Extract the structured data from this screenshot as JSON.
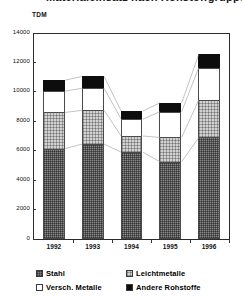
{
  "chart": {
    "title": "Materialeinsatz nach Rohstoffgruppen",
    "unit_label": "TDM"
  },
  "chart_data": {
    "type": "bar",
    "subtype": "stacked-bar",
    "title": "Materialeinsatz nach Rohstoffgruppen",
    "xlabel": "",
    "ylabel": "TDM",
    "ylim": [
      0,
      14000
    ],
    "ytick_step": 2000,
    "yticks": [
      0,
      2000,
      4000,
      6000,
      8000,
      10000,
      12000,
      14000
    ],
    "ytick_labels": [
      "0",
      "2000",
      "4000",
      "6000",
      "8000",
      "10000",
      "12000",
      "14000"
    ],
    "grid": false,
    "legend_position": "bottom",
    "categories": [
      "1992",
      "1993",
      "1994",
      "1995",
      "1996"
    ],
    "series": [
      {
        "name": "Stahl",
        "pattern": "dark-hatch",
        "color": "#8a8a8a",
        "values": [
          6150,
          6450,
          5900,
          5250,
          6900
        ]
      },
      {
        "name": "Leichtmetalle",
        "pattern": "light-dot",
        "color": "#d2d2d2",
        "values": [
          2450,
          2300,
          1100,
          1650,
          2550
        ]
      },
      {
        "name": "Versch. Metalle",
        "pattern": "solid-white",
        "color": "#ffffff",
        "values": [
          1450,
          1500,
          1150,
          1750,
          2200
        ]
      },
      {
        "name": "Andere Rohstoffe",
        "pattern": "solid-black",
        "color": "#0d0d0d",
        "values": [
          750,
          800,
          550,
          600,
          900
        ]
      }
    ],
    "totals": [
      10800,
      11050,
      8700,
      9250,
      12550
    ]
  }
}
